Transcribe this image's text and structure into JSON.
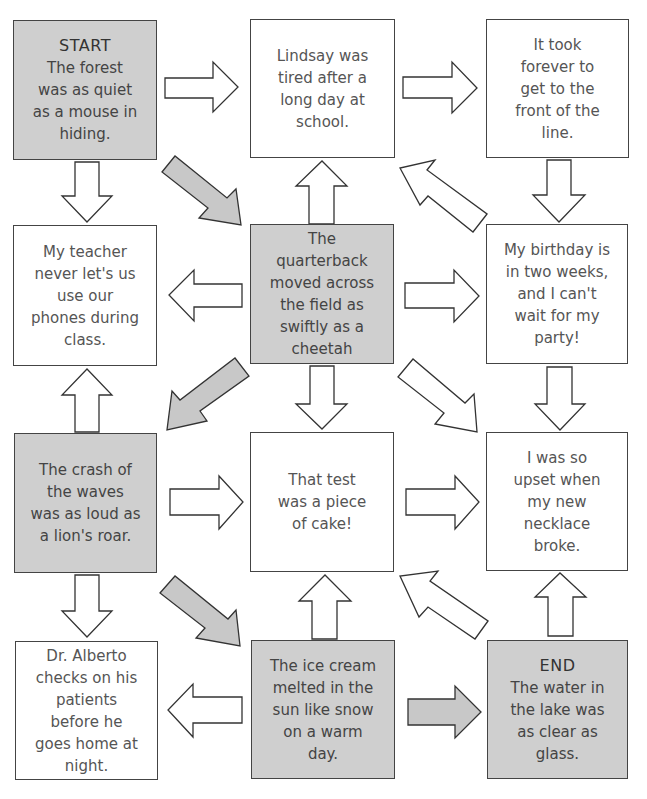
{
  "boxes": [
    {
      "id": "start",
      "row": 1,
      "col": 1,
      "shaded": true,
      "heading": "START",
      "text": "The forest\nwas as quiet\nas a mouse in\nhiding."
    },
    {
      "id": "lindsay",
      "row": 1,
      "col": 2,
      "shaded": false,
      "heading": "",
      "text": "Lindsay was\ntired after a\nlong day at\nschool."
    },
    {
      "id": "line",
      "row": 1,
      "col": 3,
      "shaded": false,
      "heading": "",
      "text": "It took\nforever to\nget to the\nfront of the\nline."
    },
    {
      "id": "teacher",
      "row": 2,
      "col": 1,
      "shaded": false,
      "heading": "",
      "text": "My teacher\nnever let's us\nuse our\nphones during\nclass."
    },
    {
      "id": "quarterback",
      "row": 2,
      "col": 2,
      "shaded": true,
      "heading": "",
      "text": "The\nquarterback\nmoved across\nthe field as\nswiftly as a\ncheetah"
    },
    {
      "id": "birthday",
      "row": 2,
      "col": 3,
      "shaded": false,
      "heading": "",
      "text": "My birthday is\nin two weeks,\nand I can't\nwait for my\nparty!"
    },
    {
      "id": "crash",
      "row": 3,
      "col": 1,
      "shaded": true,
      "heading": "",
      "text": "The crash of\nthe waves\nwas as loud as\na lion's roar."
    },
    {
      "id": "test",
      "row": 3,
      "col": 2,
      "shaded": false,
      "heading": "",
      "text": "That test\nwas a piece\nof cake!"
    },
    {
      "id": "necklace",
      "row": 3,
      "col": 3,
      "shaded": false,
      "heading": "",
      "text": "I was so\nupset when\nmy new\nnecklace\nbroke."
    },
    {
      "id": "alberto",
      "row": 4,
      "col": 1,
      "shaded": false,
      "heading": "",
      "text": "Dr. Alberto\nchecks on his\npatients\nbefore he\ngoes home at\nnight."
    },
    {
      "id": "icecream",
      "row": 4,
      "col": 2,
      "shaded": true,
      "heading": "",
      "text": "The ice cream\nmelted in the\nsun like snow\non a warm\nday."
    },
    {
      "id": "end",
      "row": 4,
      "col": 3,
      "shaded": true,
      "heading": "END",
      "text": "The water in\nthe lake was\nas clear as\nglass."
    }
  ],
  "arrows": [
    {
      "from": "start",
      "to": "lindsay",
      "direction": "right",
      "shaded": false
    },
    {
      "from": "lindsay",
      "to": "line",
      "direction": "right",
      "shaded": false
    },
    {
      "from": "start",
      "to": "teacher",
      "direction": "down",
      "shaded": false
    },
    {
      "from": "start",
      "to": "quarterback",
      "direction": "down-right",
      "shaded": true
    },
    {
      "from": "quarterback",
      "to": "lindsay",
      "direction": "up",
      "shaded": false
    },
    {
      "from": "birthday",
      "to": "lindsay",
      "direction": "up-left",
      "shaded": false
    },
    {
      "from": "line",
      "to": "birthday",
      "direction": "down",
      "shaded": false
    },
    {
      "from": "quarterback",
      "to": "teacher",
      "direction": "left",
      "shaded": false
    },
    {
      "from": "quarterback",
      "to": "birthday",
      "direction": "right",
      "shaded": false
    },
    {
      "from": "crash",
      "to": "teacher",
      "direction": "up",
      "shaded": false
    },
    {
      "from": "quarterback",
      "to": "crash",
      "direction": "down-left",
      "shaded": true
    },
    {
      "from": "quarterback",
      "to": "test",
      "direction": "down",
      "shaded": false
    },
    {
      "from": "quarterback",
      "to": "necklace",
      "direction": "down-right",
      "shaded": false
    },
    {
      "from": "birthday",
      "to": "necklace",
      "direction": "down",
      "shaded": false
    },
    {
      "from": "crash",
      "to": "test",
      "direction": "right",
      "shaded": false
    },
    {
      "from": "test",
      "to": "necklace",
      "direction": "right",
      "shaded": false
    },
    {
      "from": "crash",
      "to": "alberto",
      "direction": "down",
      "shaded": false
    },
    {
      "from": "crash",
      "to": "icecream",
      "direction": "down-right",
      "shaded": true
    },
    {
      "from": "icecream",
      "to": "test",
      "direction": "up",
      "shaded": false
    },
    {
      "from": "end",
      "to": "test",
      "direction": "up-left",
      "shaded": false
    },
    {
      "from": "end",
      "to": "necklace",
      "direction": "up",
      "shaded": false
    },
    {
      "from": "icecream",
      "to": "alberto",
      "direction": "left",
      "shaded": false
    },
    {
      "from": "icecream",
      "to": "end",
      "direction": "right",
      "shaded": true
    }
  ]
}
